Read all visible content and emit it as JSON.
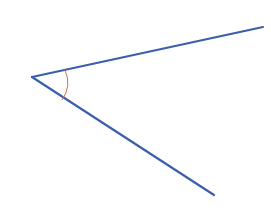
{
  "diagram": {
    "type": "angle",
    "vertex": [
      32,
      77
    ],
    "rays": [
      {
        "name": "upper-ray",
        "end": [
          263,
          27
        ]
      },
      {
        "name": "lower-ray",
        "end": [
          214,
          195
        ]
      }
    ],
    "arc": {
      "start": [
        66,
        70
      ],
      "end": [
        62,
        100
      ]
    },
    "colors": {
      "ray": "#3b5fae",
      "arc": "#e06a4a",
      "background": "#ffffff"
    }
  }
}
